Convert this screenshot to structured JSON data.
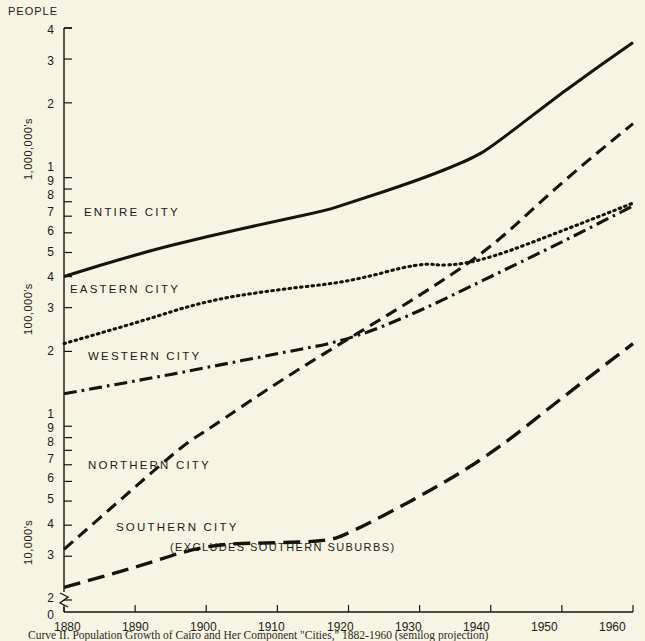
{
  "figure": {
    "background_color": "#f7f4e4",
    "ink_color": "#14140c",
    "header_label": "PEOPLE",
    "caption": "Curve II. Population Growth of Cairo and Her Component \"Cities,\" 1882-1960 (semilog projection)",
    "unit_labels": [
      {
        "text": "1,000,000's"
      },
      {
        "text": "100,000's"
      },
      {
        "text": "10,000's"
      }
    ],
    "y_axis_numbers_upper": [
      "4",
      "3",
      "2",
      "1",
      "9",
      "8",
      "7",
      "6",
      "5",
      "4",
      "3",
      "2"
    ],
    "y_axis_numbers_lower": [
      "1",
      "9",
      "8",
      "7",
      "6",
      "5",
      "4",
      "3",
      "2",
      "0"
    ],
    "axis_break_note": "0"
  },
  "chart_data": {
    "type": "line",
    "title": "Curve II. Population Growth of Cairo and Her Component \"Cities,\" 1882-1960 (semilog projection)",
    "xlabel": "",
    "ylabel": "PEOPLE",
    "yscale": "log",
    "ylim": [
      20000,
      4000000
    ],
    "xlim": [
      1880,
      1960
    ],
    "grid": false,
    "legend": "inline-labels",
    "xticks": [
      1880,
      1890,
      1900,
      1910,
      1920,
      1930,
      1940,
      1950,
      1960
    ],
    "xtick_labels": [
      "1880",
      "1890",
      "1900",
      "1910",
      "1920",
      "1930",
      "1940",
      "1950",
      "1960"
    ],
    "ytick_values": [
      4000000,
      3000000,
      2000000,
      1000000,
      900000,
      800000,
      700000,
      600000,
      500000,
      400000,
      300000,
      200000,
      100000,
      90000,
      80000,
      70000,
      60000,
      50000,
      40000,
      30000,
      20000
    ],
    "ytick_labels": [
      "4",
      "3",
      "2",
      "1",
      "9",
      "8",
      "7",
      "6",
      "5",
      "4",
      "3",
      "2",
      "1",
      "9",
      "8",
      "7",
      "6",
      "5",
      "4",
      "3",
      "2"
    ],
    "series": [
      {
        "name": "ENTIRE CITY",
        "style": "solid",
        "label_x": 1885,
        "label_y": 660000,
        "x": [
          1880,
          1890,
          1900,
          1910,
          1917,
          1920,
          1930,
          1937,
          1940,
          1950,
          1960
        ],
        "values": [
          400000,
          490000,
          580000,
          670000,
          740000,
          790000,
          980000,
          1180000,
          1320000,
          2200000,
          3500000
        ]
      },
      {
        "name": "EASTERN CITY",
        "style": "dotted",
        "label_x": 1884,
        "label_y": 330000,
        "x": [
          1880,
          1890,
          1900,
          1910,
          1920,
          1930,
          1934,
          1940,
          1950,
          1960
        ],
        "values": [
          215000,
          260000,
          320000,
          355000,
          380000,
          455000,
          440000,
          475000,
          610000,
          790000
        ]
      },
      {
        "name": "WESTERN CITY",
        "style": "dashdot",
        "label_x": 1886,
        "label_y": 210000,
        "x": [
          1880,
          1890,
          1900,
          1910,
          1920,
          1930,
          1940,
          1950,
          1960
        ],
        "values": [
          135000,
          152000,
          172000,
          196000,
          222000,
          290000,
          400000,
          550000,
          770000
        ]
      },
      {
        "name": "NORTHERN CITY",
        "style": "dashed",
        "label_x": 1886,
        "label_y": 73000,
        "x": [
          1880,
          1890,
          1897,
          1900,
          1910,
          1920,
          1930,
          1940,
          1950,
          1960
        ],
        "values": [
          32000,
          57000,
          85000,
          96000,
          150000,
          225000,
          335000,
          520000,
          960000,
          1650000
        ]
      },
      {
        "name": "SOUTHERN CITY",
        "style": "longdash",
        "sublabel": "(EXCLUDES SOUTHERN SUBURBS)",
        "label_x": 1891,
        "label_y": 37500,
        "sublabel_x": 1898,
        "sublabel_y": 31000,
        "x": [
          1880,
          1890,
          1900,
          1910,
          1917,
          1920,
          1930,
          1940,
          1950,
          1960
        ],
        "values": [
          22500,
          27000,
          33500,
          34000,
          34500,
          37000,
          52000,
          77000,
          130000,
          215000
        ]
      }
    ]
  }
}
